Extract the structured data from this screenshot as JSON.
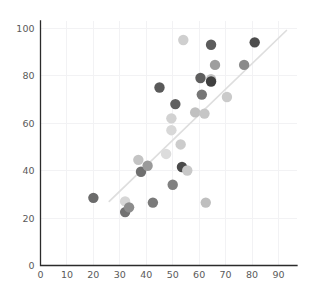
{
  "chart_data": {
    "type": "scatter",
    "title": "",
    "subtitle": "",
    "xlabel": "",
    "ylabel": "",
    "xlim": [
      0,
      97
    ],
    "ylim": [
      0,
      103
    ],
    "xticks": [
      0,
      10,
      20,
      30,
      40,
      50,
      60,
      70,
      80,
      90
    ],
    "yticks": [
      0,
      20,
      40,
      60,
      80,
      100
    ],
    "xtick_labels": [
      "0",
      "10",
      "20",
      "30",
      "40",
      "50",
      "60",
      "70",
      "80",
      "90"
    ],
    "ytick_labels": [
      "0",
      "20",
      "40",
      "60",
      "80",
      "100"
    ],
    "grid": true,
    "grid_color": "#f2f2f4",
    "legend": null,
    "legend_position": "none",
    "marker_size": 5.2,
    "axis_color": "#2b2b2b",
    "tick_label_color": "#5a5a5a",
    "trendline": {
      "show": true,
      "color": "#dedede",
      "x_start": 26.0,
      "y_start": 27.0,
      "x_end": 93.0,
      "y_end": 99.0
    },
    "points": [
      {
        "x": 20.0,
        "y": 28.5,
        "color": "#6b6b6b"
      },
      {
        "x": 32.0,
        "y": 27.0,
        "color": "#d6d6d6"
      },
      {
        "x": 32.0,
        "y": 22.5,
        "color": "#727272"
      },
      {
        "x": 33.5,
        "y": 24.5,
        "color": "#8c8c8c"
      },
      {
        "x": 37.0,
        "y": 44.5,
        "color": "#c4c4c4"
      },
      {
        "x": 38.0,
        "y": 39.5,
        "color": "#6f6f6f"
      },
      {
        "x": 40.5,
        "y": 42.0,
        "color": "#9a9a9a"
      },
      {
        "x": 42.5,
        "y": 26.5,
        "color": "#7a7a7a"
      },
      {
        "x": 45.0,
        "y": 75.0,
        "color": "#5a5a5a"
      },
      {
        "x": 47.5,
        "y": 47.0,
        "color": "#dcdcdc"
      },
      {
        "x": 49.5,
        "y": 62.0,
        "color": "#d2d2d2"
      },
      {
        "x": 49.5,
        "y": 57.0,
        "color": "#d8d8d8"
      },
      {
        "x": 50.0,
        "y": 34.0,
        "color": "#808080"
      },
      {
        "x": 51.0,
        "y": 68.0,
        "color": "#606060"
      },
      {
        "x": 53.0,
        "y": 51.0,
        "color": "#cccccc"
      },
      {
        "x": 53.5,
        "y": 41.5,
        "color": "#4a4a4a"
      },
      {
        "x": 54.0,
        "y": 95.0,
        "color": "#cfcfcf"
      },
      {
        "x": 55.5,
        "y": 40.0,
        "color": "#c8c8c8"
      },
      {
        "x": 58.5,
        "y": 64.5,
        "color": "#c0c0c0"
      },
      {
        "x": 60.5,
        "y": 79.0,
        "color": "#5e5e5e"
      },
      {
        "x": 61.0,
        "y": 72.0,
        "color": "#767676"
      },
      {
        "x": 62.0,
        "y": 64.0,
        "color": "#c6c6c6"
      },
      {
        "x": 62.5,
        "y": 26.5,
        "color": "#bfbfbf"
      },
      {
        "x": 64.5,
        "y": 78.5,
        "color": "#c2c2c2"
      },
      {
        "x": 64.5,
        "y": 77.5,
        "color": "#3f3f3f"
      },
      {
        "x": 64.5,
        "y": 93.0,
        "color": "#5c5c5c"
      },
      {
        "x": 66.0,
        "y": 84.5,
        "color": "#9e9e9e"
      },
      {
        "x": 70.5,
        "y": 71.0,
        "color": "#cacaca"
      },
      {
        "x": 77.0,
        "y": 84.5,
        "color": "#8a8a8a"
      },
      {
        "x": 81.0,
        "y": 94.0,
        "color": "#4d4d4d"
      }
    ]
  }
}
